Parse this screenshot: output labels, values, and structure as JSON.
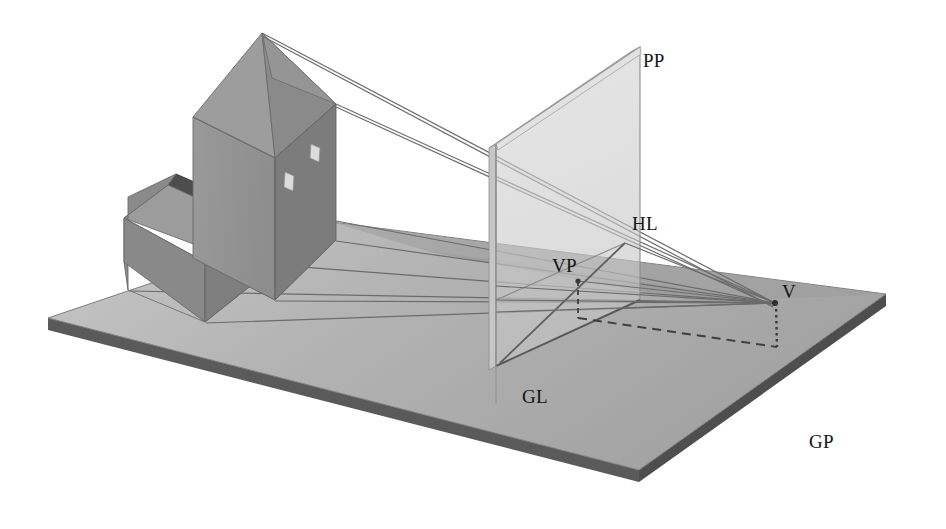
{
  "diagram": {
    "kind": "3d-perspective-construction-diagram",
    "background_color": "#ffffff",
    "labels": [
      {
        "id": "PP",
        "text": "PP",
        "meaning": "picture plane",
        "x": 643,
        "y": 67,
        "anchor": "start"
      },
      {
        "id": "HL",
        "text": "HL",
        "meaning": "horizon line",
        "x": 632,
        "y": 230,
        "anchor": "start"
      },
      {
        "id": "VP",
        "text": "VP",
        "meaning": "vanishing point",
        "x": 556,
        "y": 272,
        "anchor": "start"
      },
      {
        "id": "V",
        "text": "V",
        "meaning": "viewpoint / eye",
        "x": 782,
        "y": 298,
        "anchor": "start"
      },
      {
        "id": "GL",
        "text": "GL",
        "meaning": "ground line",
        "x": 522,
        "y": 403,
        "anchor": "start"
      },
      {
        "id": "GP",
        "text": "GP",
        "meaning": "ground plane",
        "x": 809,
        "y": 448,
        "anchor": "start"
      }
    ],
    "colors": {
      "ground_top": "#a8a8a8",
      "ground_top_light": "#c3c3c3",
      "ground_edge": "#5c5c5c",
      "ground_shadow": "#9a9a9a",
      "picture_plane_face": "#cfcfcf",
      "picture_plane_edge": "#b0b0b0",
      "picture_plane_outline": "#8a8a8a",
      "tower_left_face": "#8f8f8f",
      "tower_right_face": "#7e7e7e",
      "roof_left": "#9a9a9a",
      "roof_right": "#8a8a8a",
      "house_front": "#878787",
      "house_side": "#7b7b7b",
      "house_roof_light": "#9e9e9e",
      "house_roof_dark": "#4f4f4f",
      "window_fill": "#dadada",
      "ray_line": "#6e6e6e",
      "construction_line": "#555555",
      "label_color": "#141414"
    },
    "geometry": {
      "ground_plane": {
        "top_corners": [
          [
            48,
            318
          ],
          [
            332,
            222
          ],
          [
            886,
            294
          ],
          [
            639,
            470
          ]
        ],
        "thickness": 12
      },
      "picture_plane": {
        "corners": [
          [
            640,
            47
          ],
          [
            496,
            144
          ],
          [
            496,
            366
          ],
          [
            640,
            300
          ]
        ],
        "slab_depth": 8
      },
      "viewpoint": {
        "x": 775,
        "y": 303
      },
      "vanishing_point": {
        "x": 578,
        "y": 281
      },
      "horizon_point": {
        "x": 625,
        "y": 243
      },
      "tower": {
        "apex": [
          262,
          33
        ],
        "base_front": [
          [
            193,
            258
          ],
          [
            275,
            300
          ],
          [
            336,
            240
          ],
          [
            272,
            208
          ]
        ],
        "top_front": [
          [
            193,
            117
          ],
          [
            275,
            158
          ],
          [
            336,
            104
          ],
          [
            272,
            78
          ]
        ]
      },
      "house": {
        "ridge": [
          [
            168,
            185
          ],
          [
            262,
            228
          ]
        ],
        "base": [
          [
            128,
            290
          ],
          [
            205,
            322
          ],
          [
            268,
            272
          ],
          [
            190,
            244
          ]
        ]
      },
      "windows": [
        {
          "x": 309,
          "y": 146,
          "w": 9,
          "h": 14
        },
        {
          "x": 284,
          "y": 174,
          "w": 9,
          "h": 15
        }
      ]
    },
    "elements": {
      "ground_plane_name": "ground plane slab",
      "picture_plane_name": "transparent picture plane",
      "tower_name": "church tower with pyramidal roof",
      "house_name": "nave with gabled roof",
      "rays_name": "projection rays converging at viewpoint",
      "dashed_name": "dashed construction line from VP foot to V foot",
      "dotted_name": "dotted vertical drop line at V"
    }
  }
}
